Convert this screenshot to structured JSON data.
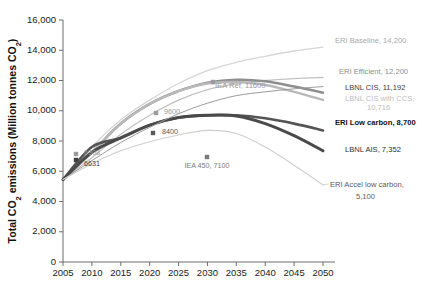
{
  "chart_data": {
    "type": "line",
    "title": "",
    "xlabel": "",
    "ylabel": "Total CO2 emissions (Million tonnes CO2)",
    "xlim": [
      2005,
      2050
    ],
    "ylim": [
      0,
      16000
    ],
    "grid": false,
    "legend_position": "right-inline-labels",
    "x": [
      2005,
      2010,
      2015,
      2020,
      2025,
      2030,
      2035,
      2040,
      2045,
      2050
    ],
    "xtick_labels": [
      "2005",
      "2010",
      "2015",
      "2020",
      "2025",
      "2030",
      "2035",
      "2040",
      "2045",
      "2050"
    ],
    "ytick_labels": [
      "0",
      "2,000",
      "4,000",
      "6,000",
      "8,000",
      "10,000",
      "12,000",
      "14,000",
      "16,000"
    ],
    "ytick_values": [
      0,
      2000,
      4000,
      6000,
      8000,
      10000,
      12000,
      14000,
      16000
    ],
    "series": [
      {
        "name": "ERI Baseline",
        "end_value": 14200,
        "label": "ERI Baseline, 14,200",
        "color": "#d5d5d5",
        "width": 1.3,
        "values": [
          5450,
          7600,
          9400,
          10700,
          11800,
          12650,
          13200,
          13600,
          13950,
          14200
        ]
      },
      {
        "name": "ERI Efficient",
        "end_value": 12200,
        "label": "ERI Efficient, 12,200",
        "color": "#c2c2c2",
        "width": 1.3,
        "values": [
          5450,
          6900,
          8450,
          9700,
          10700,
          11400,
          11800,
          12000,
          12120,
          12200
        ]
      },
      {
        "name": "LBNL CIS",
        "end_value": 11192,
        "label": "LBNL CIS, 11,192",
        "color": "#8e8e8e",
        "width": 2.6,
        "values": [
          5450,
          7250,
          9150,
          10450,
          11300,
          11850,
          12050,
          11950,
          11600,
          11192
        ]
      },
      {
        "name": "LBNL CIS with CCS",
        "end_value": 10716,
        "label": "LBNL CIS with CCS, 10,716",
        "color": "#b9b9b9",
        "width": 2.4,
        "values": [
          5450,
          7250,
          9150,
          10450,
          11300,
          11800,
          11900,
          11700,
          11250,
          10716
        ]
      },
      {
        "name": "ERI Low carbon",
        "end_value": 8700,
        "label": "ERI Low carbon, 8,700",
        "color": "#555555",
        "width": 2.6,
        "values": [
          5450,
          7600,
          8200,
          9050,
          9550,
          9700,
          9700,
          9500,
          9150,
          8700
        ]
      },
      {
        "name": "LBNL AIS",
        "end_value": 7352,
        "label": "LBNL AIS, 7,352",
        "color": "#4a4a4a",
        "width": 3.0,
        "values": [
          5450,
          7250,
          8200,
          9050,
          9550,
          9700,
          9650,
          9150,
          8350,
          7352
        ]
      },
      {
        "name": "IEA Reference",
        "end_value": 11600,
        "label": "IEA Ref, 11600",
        "color": "#9b9b9b",
        "width": 1.0,
        "values": [
          5450,
          6700,
          7900,
          8900,
          9800,
          10500,
          11000,
          11250,
          11450,
          11600
        ]
      },
      {
        "name": "ERI Accel low carbon",
        "end_value": 5100,
        "label": "ERI Accel low carbon, 5,100",
        "color": "#cfcfcf",
        "width": 1.1,
        "values": [
          5450,
          6500,
          7350,
          7950,
          8400,
          8700,
          8500,
          7600,
          6400,
          5100
        ]
      }
    ],
    "annotations": [
      {
        "name": "eri-baseline-label",
        "text": "ERI Baseline, 14,200",
        "x": 335,
        "y": 43,
        "color": "#a8a8a8",
        "bold": false,
        "anchor": "start"
      },
      {
        "name": "eri-efficient-label",
        "text": "ERI Efficient, 12,200",
        "x": 339,
        "y": 74,
        "color": "#8d8d8d",
        "bold": false,
        "anchor": "start"
      },
      {
        "name": "lbnl-cis-label",
        "text": "LBNL CIS, 11,192",
        "x": 345,
        "y": 90,
        "color": "#3d3d3d",
        "bold": false,
        "anchor": "start"
      },
      {
        "name": "lbnl-cis-ccs-label-line1",
        "text": "LBNL CIS with CCS,",
        "x": 345,
        "y": 101,
        "color": "#bdbdbd",
        "bold": false,
        "anchor": "start"
      },
      {
        "name": "lbnl-cis-ccs-label-line2",
        "text": "10,716",
        "x": 367,
        "y": 110,
        "color": "#bdbdbd",
        "bold": false,
        "anchor": "start"
      },
      {
        "name": "eri-low-carbon-label",
        "text": "ERI Low carbon, 8,700",
        "x": 335,
        "y": 125,
        "color": "#111111",
        "bold": true,
        "anchor": "start"
      },
      {
        "name": "lbnl-ais-label",
        "text": "LBNL AIS, 7,352",
        "x": 345,
        "y": 152,
        "color": "#2f2f2f",
        "bold": false,
        "anchor": "start"
      },
      {
        "name": "eri-accel-label-line1",
        "text": "ERI Accel low carbon,",
        "x": 330,
        "y": 187,
        "color": "#5a5a5a",
        "bold": false,
        "anchor": "start"
      },
      {
        "name": "eri-accel-label-line2",
        "text": "5,100",
        "x": 356,
        "y": 199,
        "color": "#5a5a5a",
        "bold": false,
        "anchor": "start"
      },
      {
        "name": "iea-ref-label",
        "text": "IEA Ref, 11600",
        "x": 215,
        "y": 88,
        "color": "#9a9a9a",
        "bold": false,
        "anchor": "start"
      }
    ],
    "point_markers": [
      {
        "name": "point-6908",
        "text": "6908",
        "px": 76,
        "py": 154,
        "lx": 84,
        "ly": 155,
        "color": "#9b9b9b"
      },
      {
        "name": "point-6631",
        "text": "6631",
        "px": 76,
        "py": 160,
        "lx": 84,
        "ly": 166,
        "color": "#3f3f3f"
      },
      {
        "name": "point-9600",
        "text": "9600",
        "px": 156,
        "py": 113,
        "lx": 164,
        "ly": 114,
        "color": "#9b9b9b"
      },
      {
        "name": "point-8400",
        "text": "8400",
        "px": 153,
        "py": 133,
        "lx": 162,
        "ly": 134,
        "color": "#5a5a5a"
      },
      {
        "name": "point-iea450",
        "text": "IEA 450, 7100",
        "px": 207,
        "py": 157,
        "lx": 207,
        "ly": 168,
        "color": "#7a7a7a"
      },
      {
        "name": "point-iea-ref",
        "text": "",
        "px": 213,
        "py": 82,
        "lx": 0,
        "ly": 0,
        "color": "#9b9b9b"
      }
    ]
  },
  "axis": {
    "ylabel": "Total CO2 emissions (Million tonnes CO2)",
    "ylabel_prefix": "Total CO",
    "ylabel_mid": " emissions (Million tonnes CO",
    "ylabel_suffix": ")",
    "sub2": "2"
  }
}
